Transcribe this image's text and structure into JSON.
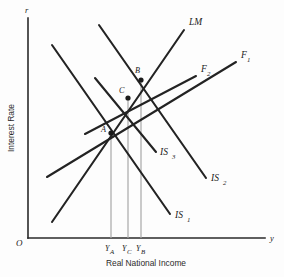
{
  "figure": {
    "type": "diagram",
    "background_color": "#fdfdfd",
    "line_color": "#232323",
    "dropline_color": "#a8a8a8"
  },
  "axes": {
    "y_axis": {
      "variable_label": "r",
      "title": "Interest Rate",
      "origin_label": "O",
      "top_y": 18,
      "bottom_y": 238,
      "x": 28
    },
    "x_axis": {
      "variable_label": "y",
      "title": "Real National Income",
      "left_x": 28,
      "right_x": 265,
      "y": 238
    }
  },
  "curves": [
    {
      "name": "LM",
      "label": "LM",
      "label_x": 189,
      "label_y": 25,
      "x1": 52,
      "y1": 222,
      "x2": 184,
      "y2": 30,
      "slope": "upward"
    },
    {
      "name": "F1",
      "label": "F",
      "subscript": "1",
      "label_x": 241,
      "label_y": 58,
      "x1": 47,
      "y1": 177,
      "x2": 236,
      "y2": 62,
      "slope": "upward"
    },
    {
      "name": "F2",
      "label": "F",
      "subscript": "2",
      "label_x": 201,
      "label_y": 72,
      "x1": 85,
      "y1": 134,
      "x2": 196,
      "y2": 76,
      "slope": "upward"
    },
    {
      "name": "IS1",
      "label": "IS",
      "subscript": "1",
      "label_x": 175,
      "label_y": 218,
      "x1": 52,
      "y1": 45,
      "x2": 170,
      "y2": 214,
      "slope": "downward"
    },
    {
      "name": "IS2",
      "label": "IS",
      "subscript": "2",
      "label_x": 211,
      "label_y": 181,
      "x1": 99,
      "y1": 25,
      "x2": 206,
      "y2": 178,
      "slope": "downward"
    },
    {
      "name": "IS3",
      "label": "IS",
      "subscript": "3",
      "label_x": 160,
      "label_y": 155,
      "x1": 95,
      "y1": 78,
      "x2": 156,
      "y2": 152,
      "slope": "downward"
    }
  ],
  "points": [
    {
      "name": "A",
      "label": "A",
      "x": 111,
      "y": 133,
      "label_x": 102,
      "label_y": 132
    },
    {
      "name": "B",
      "label": "B",
      "x": 141,
      "y": 80,
      "label_x": 135,
      "label_y": 73
    },
    {
      "name": "C",
      "label": "C",
      "x": 128,
      "y": 98,
      "label_x": 120,
      "label_y": 93
    }
  ],
  "droplines": [
    {
      "name": "YA",
      "x": 111,
      "y_top": 133,
      "y_bottom": 238
    },
    {
      "name": "YC",
      "x": 128,
      "y_top": 98,
      "y_bottom": 238
    },
    {
      "name": "YB",
      "x": 141,
      "y_top": 80,
      "y_bottom": 238
    }
  ],
  "tick_labels": [
    {
      "name": "YA",
      "base": "Y",
      "subscript": "A",
      "x": 107,
      "y": 250
    },
    {
      "name": "YC",
      "base": "Y",
      "subscript": "C",
      "x": 125,
      "y": 250
    },
    {
      "name": "YB",
      "base": "Y",
      "subscript": "B",
      "x": 138,
      "y": 250
    }
  ]
}
